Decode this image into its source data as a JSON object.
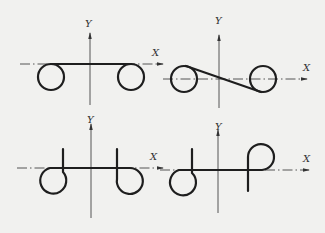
{
  "diagram": {
    "panels": [
      {
        "id": "top-left",
        "x_label": "X",
        "y_label": "Y",
        "shape": "two circles joined by straight tangent along X axis"
      },
      {
        "id": "top-right",
        "x_label": "X",
        "y_label": "Y",
        "shape": "two circles joined by diagonal cross tangent through origin"
      },
      {
        "id": "bottom-left",
        "x_label": "X",
        "y_label": "Y",
        "shape": "two hooks below X axis with vertical stems"
      },
      {
        "id": "bottom-right",
        "x_label": "X",
        "y_label": "Y",
        "shape": "one hook below and one loop above X axis"
      }
    ]
  },
  "colors": {
    "background": "#f1f1ef",
    "line": "#1e1e1e",
    "axis": "#444444"
  }
}
